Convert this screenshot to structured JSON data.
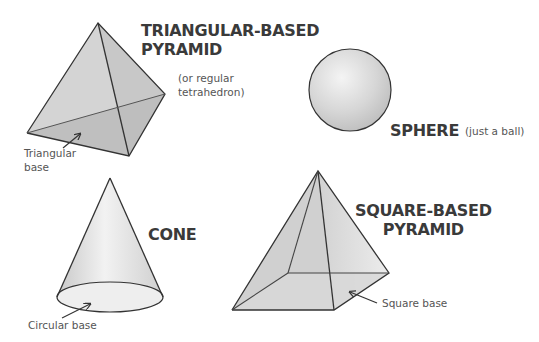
{
  "shapes": {
    "tetrahedron": {
      "title_line1": "TRIANGULAR-BASED",
      "title_line2": "PYRAMID",
      "subtitle_line1": "(or regular",
      "subtitle_line2": "tetrahedron)",
      "base_label_line1": "Triangular",
      "base_label_line2": "base"
    },
    "sphere": {
      "title": "SPHERE",
      "subtitle": "(just a ball)"
    },
    "cone": {
      "title": "CONE",
      "base_label": "Circular base"
    },
    "square_pyramid": {
      "title_line1": "SQUARE-BASED",
      "title_line2": "PYRAMID",
      "base_label": "Square base"
    }
  },
  "colors": {
    "face_light": "#dcdcdc",
    "face_dark": "#c4c4c4",
    "outline": "#333333",
    "text": "#3a3a3a"
  }
}
